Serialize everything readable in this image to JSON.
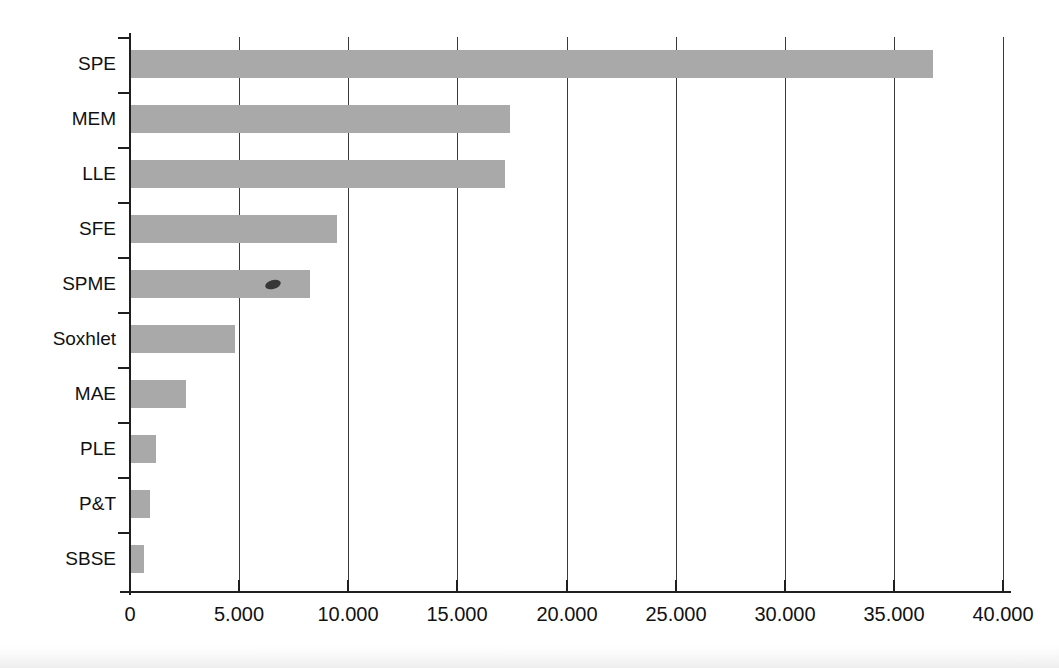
{
  "chart_data": {
    "type": "bar",
    "orientation": "horizontal",
    "title": "",
    "subtitle": "",
    "xlabel": "",
    "ylabel": "",
    "categories": [
      "SPE",
      "MEM",
      "LLE",
      "SFE",
      "SPME",
      "Soxhlet",
      "MAE",
      "PLE",
      "P&T",
      "SBSE"
    ],
    "values": [
      36800,
      17400,
      17200,
      9500,
      8250,
      4800,
      2550,
      1200,
      900,
      650
    ],
    "series": [
      {
        "name": "Number of publications",
        "values": [
          36800,
          17400,
          17200,
          9500,
          8250,
          4800,
          2550,
          1200,
          900,
          650
        ]
      }
    ],
    "xlim": [
      0,
      40000
    ],
    "ylim": [
      0,
      10
    ],
    "xticks": [
      0,
      5000,
      10000,
      15000,
      20000,
      25000,
      30000,
      35000,
      40000
    ],
    "xticklabels": [
      "0",
      "5.000",
      "10.000",
      "15.000",
      "20.000",
      "25.000",
      "30.000",
      "35.000",
      "40.000"
    ],
    "grid": true,
    "grid_axis": "x",
    "legend": false,
    "legend_position": "none",
    "bar_color": "#a9a9a9",
    "axis_color": "#1f1f1f",
    "grid_color": "#3a3a3a",
    "background_color": "#ffffff",
    "annotations": [
      {
        "name": "scan-artifact",
        "description": "small dark ink speck on the SPME bar",
        "x_value": 6200,
        "category": "SPME"
      }
    ]
  }
}
